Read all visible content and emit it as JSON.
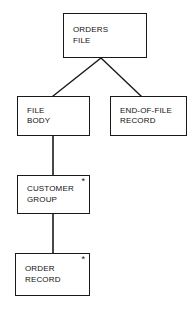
{
  "diagram": {
    "type": "hierarchical-structure-chart",
    "background_color": "#ffffff",
    "line_color": "#1a1a1a",
    "text_color": "#111111",
    "iteration_symbol": "*",
    "nodes": [
      {
        "id": "orders-file",
        "lines": [
          "ORDERS",
          "FILE"
        ],
        "line1": "ORDERS",
        "line2": "FILE",
        "iteration": "",
        "level": 0
      },
      {
        "id": "file-body",
        "lines": [
          "FILE",
          "BODY"
        ],
        "line1": "FILE",
        "line2": "BODY",
        "iteration": "",
        "level": 1
      },
      {
        "id": "eof-record",
        "lines": [
          "END-OF-FILE",
          "RECORD"
        ],
        "line1": "END-OF-FILE",
        "line2": "RECORD",
        "iteration": "",
        "level": 1
      },
      {
        "id": "customer-group",
        "lines": [
          "CUSTOMER",
          "GROUP"
        ],
        "line1": "CUSTOMER",
        "line2": "GROUP",
        "iteration": "*",
        "level": 2
      },
      {
        "id": "order-record",
        "lines": [
          "ORDER",
          "RECORD"
        ],
        "line1": "ORDER",
        "line2": "RECORD",
        "iteration": "*",
        "level": 3
      }
    ],
    "edges": [
      {
        "id": "edge-orders-to-file-body",
        "from": "orders-file",
        "to": "file-body",
        "style": "diagonal"
      },
      {
        "id": "edge-orders-to-eof-record",
        "from": "orders-file",
        "to": "eof-record",
        "style": "diagonal"
      },
      {
        "id": "edge-file-body-to-customer",
        "from": "file-body",
        "to": "customer-group",
        "style": "vertical"
      },
      {
        "id": "edge-customer-to-order-record",
        "from": "customer-group",
        "to": "order-record",
        "style": "vertical"
      }
    ]
  }
}
